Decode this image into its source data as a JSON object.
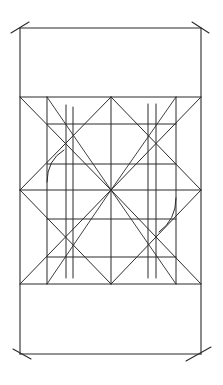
{
  "diagram": {
    "type": "geometric-construction",
    "stroke_color": "#2b2b2b",
    "background_color": "#ffffff",
    "outer_frame": {
      "x1": 20,
      "y1": 28,
      "x2": 201,
      "y2": 354
    },
    "grid_band": {
      "y_top": 97,
      "y_bottom": 284
    },
    "center": {
      "x": 111,
      "y": 190
    },
    "vertical_lines_x": [
      20,
      47,
      66,
      73,
      111,
      148,
      156,
      176,
      201
    ],
    "horizontal_lines_y": [
      28,
      97,
      124,
      164,
      190,
      219,
      257,
      284,
      354
    ],
    "corner_ticks": [
      {
        "corner": "top-left",
        "from": [
          11,
          33
        ],
        "to": [
          29,
          22
        ]
      },
      {
        "corner": "top-right",
        "from": [
          192,
          22
        ],
        "to": [
          209,
          33
        ]
      },
      {
        "corner": "bottom-left",
        "from": [
          13,
          349
        ],
        "to": [
          31,
          359
        ]
      },
      {
        "corner": "bottom-right",
        "from": [
          186,
          361
        ],
        "to": [
          211,
          347
        ]
      }
    ],
    "arcs": [
      {
        "name": "left-arc",
        "from": [
          47,
          182
        ],
        "to": [
          64,
          150
        ]
      },
      {
        "name": "right-arc",
        "from": [
          176,
          198
        ],
        "to": [
          159,
          232
        ]
      }
    ]
  }
}
